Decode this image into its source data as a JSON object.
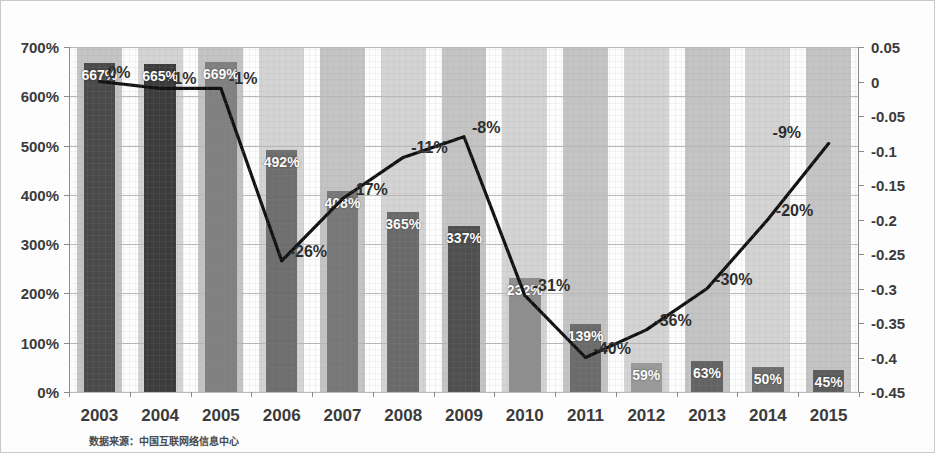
{
  "chart_data": {
    "type": "bar",
    "title": "",
    "subtitle": "",
    "xlabel": "",
    "ylabel": "",
    "source_note": "数据来源：中国互联网络信息中心",
    "categories": [
      "2003",
      "2004",
      "2005",
      "2006",
      "2007",
      "2008",
      "2009",
      "2010",
      "2011",
      "2012",
      "2013",
      "2014",
      "2015"
    ],
    "grid": true,
    "legend_position": "none",
    "series": [
      {
        "name": "bars",
        "type": "bar",
        "axis": "left",
        "values": [
          667,
          665,
          669,
          492,
          408,
          365,
          337,
          232,
          139,
          59,
          63,
          50,
          45
        ],
        "labels": [
          "667%",
          "665%",
          "669%",
          "492%",
          "408%",
          "365%",
          "337%",
          "232%",
          "139%",
          "59%",
          "63%",
          "50%",
          "45%"
        ],
        "colors": [
          "#4a4a4a",
          "#3c3c3c",
          "#808080",
          "#6e6e6e",
          "#777777",
          "#6a6a6a",
          "#4f4f4f",
          "#8e8e8e",
          "#6b6b6b",
          "#9a9a9a",
          "#636363",
          "#6d6d6d",
          "#5c5c5c"
        ]
      },
      {
        "name": "line",
        "type": "line",
        "axis": "right",
        "values": [
          0.0,
          -0.01,
          -0.01,
          -0.26,
          -0.17,
          -0.11,
          -0.08,
          -0.31,
          -0.4,
          -0.36,
          -0.3,
          -0.2,
          -0.09
        ],
        "labels": [
          "0%",
          "-1%",
          "-1%",
          "-26%",
          "-17%",
          "-11%",
          "-8%",
          "-31%",
          "-40%",
          "-36%",
          "-30%",
          "-20%",
          "-9%"
        ],
        "color": "#111111"
      }
    ],
    "left_axis": {
      "ticks": [
        "0%",
        "100%",
        "200%",
        "300%",
        "400%",
        "500%",
        "600%",
        "700%"
      ],
      "values": [
        0,
        100,
        200,
        300,
        400,
        500,
        600,
        700
      ],
      "min": 0,
      "max": 700
    },
    "right_axis": {
      "ticks": [
        "0.05",
        "0",
        "-0.05",
        "-0.1",
        "-0.15",
        "-0.2",
        "-0.25",
        "-0.3",
        "-0.35",
        "-0.4",
        "-0.45"
      ],
      "values": [
        0.05,
        0,
        -0.05,
        -0.1,
        -0.15,
        -0.2,
        -0.25,
        -0.3,
        -0.35,
        -0.4,
        -0.45
      ],
      "min": -0.45,
      "max": 0.05
    }
  }
}
